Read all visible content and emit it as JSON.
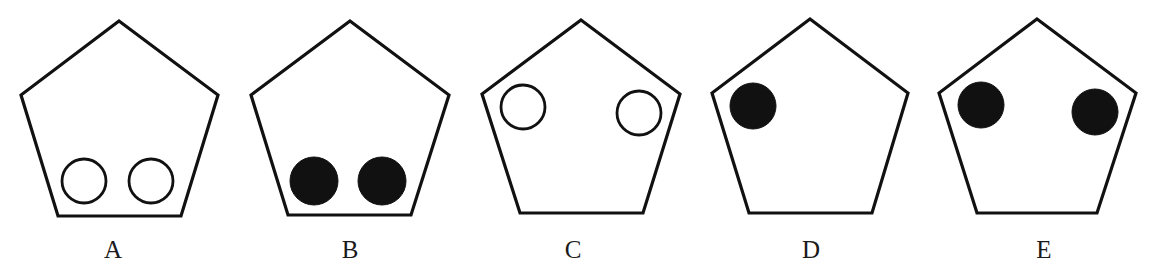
{
  "canvas": {
    "width": 1153,
    "height": 278,
    "background": "#ffffff"
  },
  "style": {
    "stroke_color": "#111111",
    "stroke_width": 3.2,
    "circle_stroke_width": 2.8,
    "filled_color": "#111111",
    "hollow_fill": "#ffffff"
  },
  "top_clipped_text": {
    "visible": "descenders only",
    "text": ""
  },
  "options": [
    {
      "label": "A",
      "label_pos": [
        113,
        258
      ],
      "pentagon": [
        [
          119,
          21
        ],
        [
          218,
          95
        ],
        [
          181,
          216
        ],
        [
          58,
          216
        ],
        [
          21,
          95
        ]
      ],
      "circles": [
        {
          "cx": 84,
          "cy": 181,
          "r": 22,
          "filled": false
        },
        {
          "cx": 151,
          "cy": 181,
          "r": 22,
          "filled": false
        }
      ]
    },
    {
      "label": "B",
      "label_pos": [
        350,
        258
      ],
      "pentagon": [
        [
          350,
          21
        ],
        [
          449,
          95
        ],
        [
          411,
          215
        ],
        [
          288,
          215
        ],
        [
          251,
          95
        ]
      ],
      "circles": [
        {
          "cx": 314,
          "cy": 181,
          "r": 24,
          "filled": true
        },
        {
          "cx": 382,
          "cy": 181,
          "r": 24,
          "filled": true
        }
      ]
    },
    {
      "label": "C",
      "label_pos": [
        573,
        258
      ],
      "pentagon": [
        [
          581,
          20
        ],
        [
          680,
          94
        ],
        [
          643,
          213
        ],
        [
          520,
          213
        ],
        [
          482,
          94
        ]
      ],
      "circles": [
        {
          "cx": 523,
          "cy": 107,
          "r": 22,
          "filled": false
        },
        {
          "cx": 639,
          "cy": 113,
          "r": 22,
          "filled": false
        }
      ]
    },
    {
      "label": "D",
      "label_pos": [
        811,
        258
      ],
      "pentagon": [
        [
          810,
          19
        ],
        [
          908,
          93
        ],
        [
          872,
          213
        ],
        [
          749,
          213
        ],
        [
          712,
          93
        ]
      ],
      "circles": [
        {
          "cx": 753,
          "cy": 106,
          "r": 23,
          "filled": true
        }
      ]
    },
    {
      "label": "E",
      "label_pos": [
        1044,
        258
      ],
      "pentagon": [
        [
          1037,
          19
        ],
        [
          1136,
          93
        ],
        [
          1097,
          213
        ],
        [
          977,
          213
        ],
        [
          939,
          93
        ]
      ],
      "circles": [
        {
          "cx": 981,
          "cy": 105,
          "r": 23,
          "filled": true
        },
        {
          "cx": 1095,
          "cy": 112,
          "r": 23,
          "filled": true
        }
      ]
    }
  ]
}
